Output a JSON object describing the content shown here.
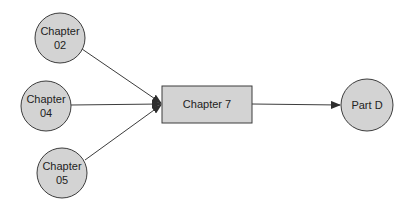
{
  "diagram": {
    "type": "flow",
    "colors": {
      "node_fill": "#d3d3d3",
      "stroke": "#3c3c3c",
      "text": "#222222",
      "background": "#ffffff"
    },
    "nodes": [
      {
        "id": "ch02",
        "shape": "circle",
        "lines": [
          "Chapter",
          "02"
        ],
        "cx": 60,
        "cy": 38,
        "r": 25
      },
      {
        "id": "ch04",
        "shape": "circle",
        "lines": [
          "Chapter",
          "04"
        ],
        "cx": 46,
        "cy": 106,
        "r": 25
      },
      {
        "id": "ch05",
        "shape": "circle",
        "lines": [
          "Chapter",
          "05"
        ],
        "cx": 62,
        "cy": 173,
        "r": 25
      },
      {
        "id": "ch7",
        "shape": "rect",
        "lines": [
          "Chapter 7"
        ],
        "x": 162,
        "y": 86,
        "w": 90,
        "h": 37
      },
      {
        "id": "partd",
        "shape": "circle",
        "lines": [
          "Part D"
        ],
        "cx": 367,
        "cy": 105,
        "r": 26
      }
    ],
    "edges": [
      {
        "from": "ch02",
        "to": "ch7"
      },
      {
        "from": "ch04",
        "to": "ch7"
      },
      {
        "from": "ch05",
        "to": "ch7"
      },
      {
        "from": "ch7",
        "to": "partd"
      }
    ]
  }
}
